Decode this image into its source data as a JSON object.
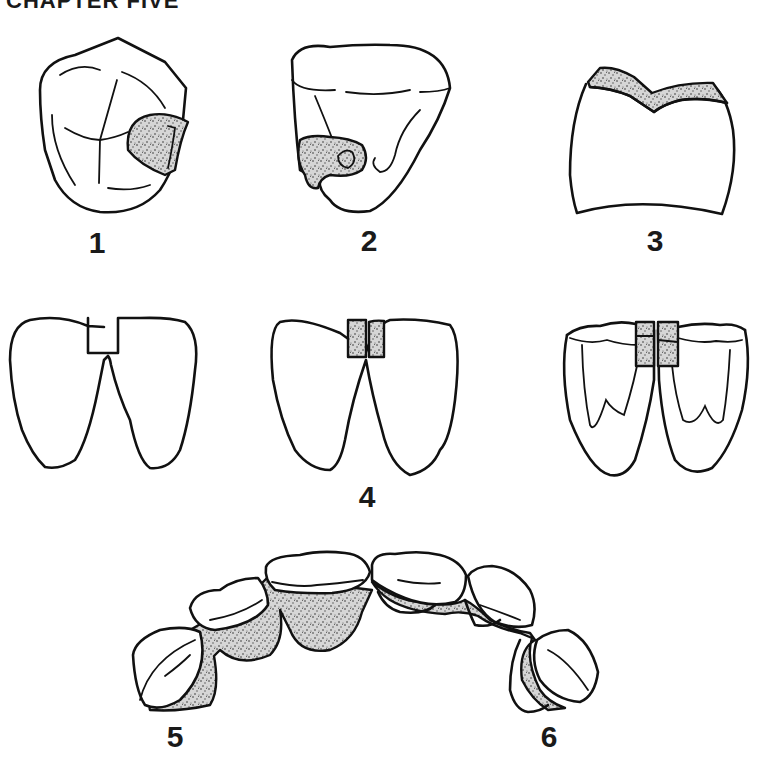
{
  "page": {
    "title": "CHAPTER FIVE"
  },
  "figures": [
    {
      "id": "1",
      "label": "1",
      "description": "Occlusal view of tooth with stippled restoration on right proximal side"
    },
    {
      "id": "2",
      "label": "2",
      "description": "Tooth with stippled lesion/restoration on lower left cervical area"
    },
    {
      "id": "3",
      "label": "3",
      "description": "Tooth crown with stippled occlusal veneer layer"
    },
    {
      "id": "4",
      "label": "4",
      "description": "Three views of paired teeth: prepared slot, filled slot, and molars with stippled interproximal splint"
    },
    {
      "id": "5",
      "label": "5",
      "description": "Dental arch (left) with stippled lingual splint"
    },
    {
      "id": "6",
      "label": "6",
      "description": "Dental arch (right) with stippled lingual wire splint"
    }
  ],
  "colors": {
    "line": "#111111",
    "stipple": "#9a9a9a",
    "background": "#ffffff"
  }
}
